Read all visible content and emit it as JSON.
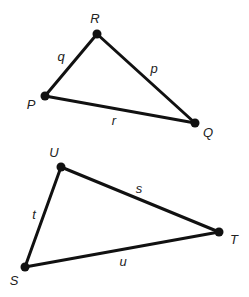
{
  "diagram": {
    "type": "triangles",
    "colors": {
      "line": "#111111",
      "label": "#222222",
      "background": "#ffffff"
    },
    "triangles": [
      {
        "name": "PQR",
        "vertices": {
          "R": {
            "label": "R",
            "x": 97,
            "y": 34,
            "lx": 95,
            "ly": 23
          },
          "P": {
            "label": "P",
            "x": 45,
            "y": 96,
            "lx": 31,
            "ly": 109
          },
          "Q": {
            "label": "Q",
            "x": 195,
            "y": 123,
            "lx": 208,
            "ly": 137
          }
        },
        "sides": {
          "q": {
            "label": "q",
            "x": 61,
            "y": 61
          },
          "p": {
            "label": "p",
            "x": 154,
            "y": 73
          },
          "r": {
            "label": "r",
            "x": 114,
            "y": 125
          }
        }
      },
      {
        "name": "STU",
        "vertices": {
          "U": {
            "label": "U",
            "x": 61,
            "y": 167,
            "lx": 54,
            "ly": 157
          },
          "S": {
            "label": "S",
            "x": 25,
            "y": 267,
            "lx": 14,
            "ly": 285
          },
          "T": {
            "label": "T",
            "x": 219,
            "y": 232,
            "lx": 234,
            "ly": 244
          }
        },
        "sides": {
          "s": {
            "label": "s",
            "x": 139,
            "y": 193
          },
          "t": {
            "label": "t",
            "x": 34,
            "y": 219
          },
          "u": {
            "label": "u",
            "x": 123,
            "y": 266
          }
        }
      }
    ]
  }
}
